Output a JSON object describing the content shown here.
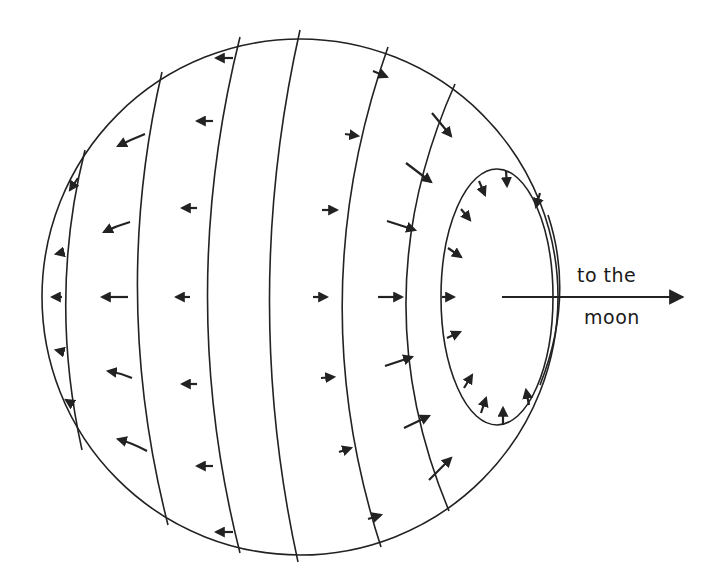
{
  "figure": {
    "label_line1": "to the",
    "label_line2": "moon",
    "colors": {
      "ink": "#222222",
      "background": "#ffffff"
    },
    "elements": [
      "earth-outline-circle",
      "contour-lines",
      "tidal-bulge-ellipse",
      "force-vectors",
      "moon-direction-arrow"
    ]
  }
}
